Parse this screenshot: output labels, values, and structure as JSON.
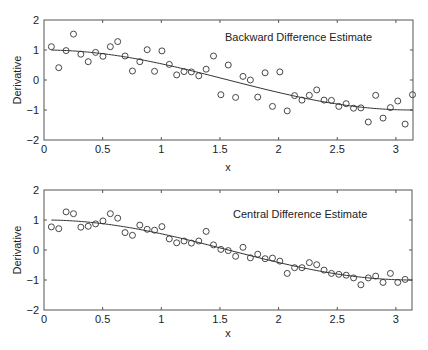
{
  "figure": {
    "width": 428,
    "height": 350,
    "line_color": "#333333",
    "axis_color": "#555555",
    "marker_color": "#333333",
    "background": "#ffffff"
  },
  "chart_data": [
    {
      "type": "scatter",
      "title": "Backward Difference Estimate",
      "xlabel": "x",
      "ylabel": "Derivative",
      "xlim": [
        0,
        3.2
      ],
      "ylim": [
        -2,
        2
      ],
      "xticks": [
        0,
        0.5,
        1,
        1.5,
        2,
        2.5,
        3
      ],
      "xtick_labels": [
        "0",
        "0.5",
        "1",
        "1.5",
        "2",
        "2.5",
        "3"
      ],
      "yticks": [
        2,
        1,
        0,
        -1,
        -2
      ],
      "ytick_labels": [
        "2",
        "1",
        "0",
        "−1",
        "−2"
      ],
      "grid": false,
      "legend": null,
      "series": [
        {
          "name": "Backward difference estimate",
          "style": "open-circle markers",
          "x_rule": "k*pi/50, k=1..50",
          "values": [
            1.11,
            0.41,
            0.98,
            1.53,
            0.86,
            0.61,
            0.92,
            0.79,
            1.11,
            1.28,
            0.8,
            0.3,
            0.61,
            1.01,
            0.29,
            0.97,
            0.52,
            0.17,
            0.28,
            0.27,
            0.14,
            0.36,
            0.8,
            -0.49,
            0.5,
            -0.58,
            0.12,
            0.0,
            -0.57,
            0.24,
            -0.88,
            0.27,
            -1.03,
            -0.52,
            -0.67,
            -0.51,
            -0.33,
            -0.67,
            -0.68,
            -0.88,
            -0.79,
            -0.94,
            -0.93,
            -1.4,
            -0.51,
            -1.27,
            -0.92,
            -0.7,
            -1.47,
            -0.49
          ]
        },
        {
          "name": "True derivative cos(x)",
          "style": "solid line",
          "function": "cos(x)",
          "x_range": [
            0.0628,
            3.1416
          ]
        }
      ]
    },
    {
      "type": "scatter",
      "title": "Central Difference Estimate",
      "xlabel": "x",
      "ylabel": "Derivative",
      "xlim": [
        0,
        3.2
      ],
      "ylim": [
        -2,
        2
      ],
      "xticks": [
        0,
        0.5,
        1,
        1.5,
        2,
        2.5,
        3
      ],
      "xtick_labels": [
        "0",
        "0.5",
        "1",
        "1.5",
        "2",
        "2.5",
        "3"
      ],
      "yticks": [
        2,
        1,
        0,
        -1,
        -2
      ],
      "ytick_labels": [
        "2",
        "1",
        "0",
        "−1",
        "−2"
      ],
      "grid": false,
      "legend": null,
      "series": [
        {
          "name": "Central difference estimate",
          "style": "open-circle markers",
          "x_rule": "k*pi/50, k=1..49",
          "values": [
            0.77,
            0.71,
            1.27,
            1.21,
            0.76,
            0.79,
            0.87,
            0.97,
            1.21,
            1.06,
            0.58,
            0.49,
            0.83,
            0.69,
            0.66,
            0.78,
            0.37,
            0.24,
            0.3,
            0.23,
            0.3,
            0.62,
            0.17,
            0.02,
            -0.02,
            -0.21,
            0.09,
            -0.26,
            -0.14,
            -0.29,
            -0.27,
            -0.37,
            -0.78,
            -0.59,
            -0.59,
            -0.42,
            -0.49,
            -0.67,
            -0.78,
            -0.81,
            -0.84,
            -0.93,
            -1.16,
            -0.93,
            -0.87,
            -1.08,
            -0.78,
            -1.08,
            -0.98
          ]
        },
        {
          "name": "True derivative cos(x)",
          "style": "solid line",
          "function": "cos(x)",
          "x_range": [
            0.0628,
            3.1416
          ]
        }
      ]
    }
  ],
  "panels": [
    {
      "title": "Backward Difference Estimate",
      "xlabel": "x",
      "ylabel": "Derivative"
    },
    {
      "title": "Central Difference Estimate",
      "xlabel": "x",
      "ylabel": "Derivative"
    }
  ]
}
